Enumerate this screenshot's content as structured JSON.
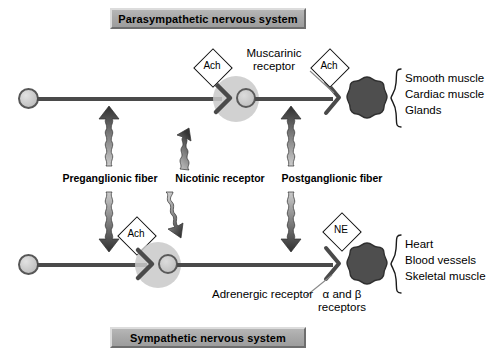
{
  "figure": {
    "background_color": "#ffffff"
  },
  "banners": {
    "top": {
      "label": "Parasympathetic nervous system",
      "fill_color": "#a9a9a9",
      "text_color": "#000000"
    },
    "bottom": {
      "label": "Sympathetic nervous system",
      "fill_color": "#a9a9a9",
      "text_color": "#000000"
    }
  },
  "middle_labels": [
    {
      "name": "preganglionic-fiber",
      "label": "Preganglionic fiber"
    },
    {
      "name": "nicotinic-receptor",
      "label": "Nicotinic receptor"
    },
    {
      "name": "postganglionic-fiber",
      "label": "Postganglionic fiber"
    }
  ],
  "parasympathetic": {
    "neurotransmitter_preganglionic": "Ach",
    "neurotransmitter_postganglionic": "Ach",
    "receptor_callout": {
      "line1": "Muscarinic",
      "line2": "receptor"
    },
    "targets": [
      "Smooth muscle",
      "Cardiac muscle",
      "Glands"
    ]
  },
  "sympathetic": {
    "neurotransmitter_preganglionic": "Ach",
    "neurotransmitter_postganglionic": "NE",
    "receptor_callout": "Adrenergic receptor",
    "receptor_subtypes": {
      "line1": "α and β",
      "line2": "receptors"
    },
    "targets": [
      "Heart",
      "Blood vessels",
      "Skeletal muscle"
    ]
  },
  "colors": {
    "axon": "#4a4a4a",
    "soma_fill": "#c9c9c9",
    "soma_border": "#575757",
    "ganglion_halo": "#c9c9c9",
    "target_organ": "#4e4e4e",
    "arrow_dark": "#3a3a3a",
    "arrow_light": "#c8c8c8",
    "callout_line": "#8a8a8a"
  }
}
